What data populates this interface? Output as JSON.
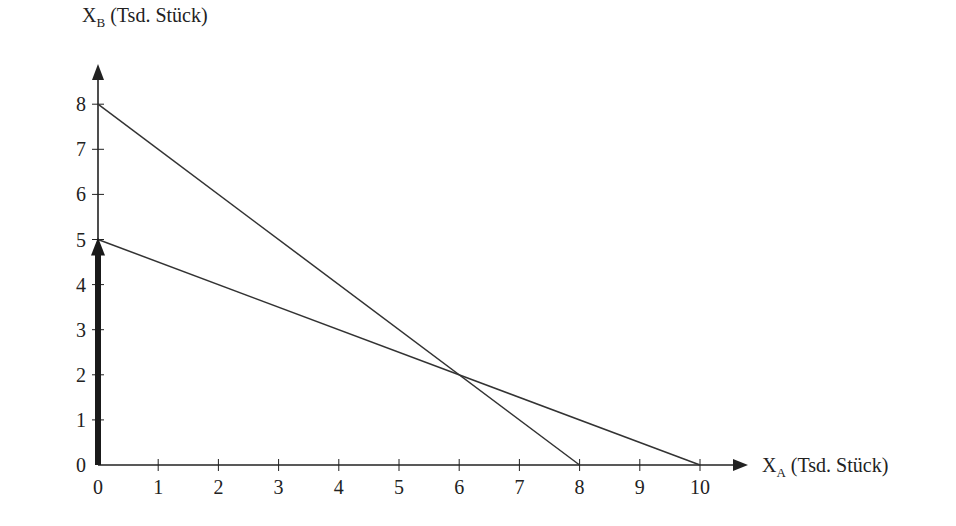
{
  "chart_data": {
    "type": "line",
    "title": "",
    "xlabel": "X_A (Tsd. Stück)",
    "ylabel": "X_B (Tsd. Stück)",
    "xlabel_parts": {
      "main": "X",
      "sub": "A",
      "rest": " (Tsd. Stück)"
    },
    "ylabel_parts": {
      "main": "X",
      "sub": "B",
      "rest": " (Tsd. Stück)"
    },
    "xlim": [
      0,
      10
    ],
    "ylim": [
      0,
      8
    ],
    "x_ticks": [
      "0",
      "1",
      "2",
      "3",
      "4",
      "5",
      "6",
      "7",
      "8",
      "9",
      "10"
    ],
    "y_ticks": [
      "0",
      "1",
      "2",
      "3",
      "4",
      "5",
      "6",
      "7",
      "8"
    ],
    "grid": false,
    "series": [
      {
        "name": "Line 1",
        "x": [
          0,
          8
        ],
        "y": [
          8,
          0
        ]
      },
      {
        "name": "Line 2",
        "x": [
          0,
          10
        ],
        "y": [
          5,
          0
        ]
      }
    ],
    "annotations": [
      {
        "type": "bold-arrow",
        "from": [
          0,
          0
        ],
        "to": [
          0,
          5
        ],
        "description": "thick arrow along y-axis from 0 to 5"
      },
      {
        "type": "intersection",
        "x": 6,
        "y": 2
      }
    ]
  },
  "colors": {
    "line": "#333333",
    "axis": "#222222",
    "arrow": "#1a1a1a"
  }
}
